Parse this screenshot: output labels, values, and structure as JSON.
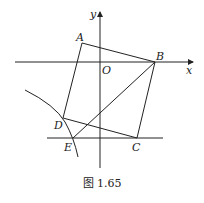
{
  "figure": {
    "caption": "图 1.65",
    "axes": {
      "x_label": "x",
      "y_label": "y",
      "origin_label": "O"
    },
    "points": {
      "A": {
        "label": "A",
        "x": 82,
        "y": 43
      },
      "B": {
        "label": "B",
        "x": 155,
        "y": 62
      },
      "C": {
        "label": "C",
        "x": 137,
        "y": 138
      },
      "D": {
        "label": "D",
        "x": 63,
        "y": 118
      },
      "E": {
        "label": "E",
        "x": 73,
        "y": 138
      },
      "O": {
        "label": "O",
        "x": 100,
        "y": 62
      }
    },
    "segments": [
      "AB",
      "BC",
      "CD",
      "DA",
      "BE"
    ],
    "lines": [
      "x-axis",
      "y-axis",
      "horizontal line through E and C"
    ],
    "curves": [
      "arc through D and E"
    ],
    "stroke_color": "#222222"
  }
}
